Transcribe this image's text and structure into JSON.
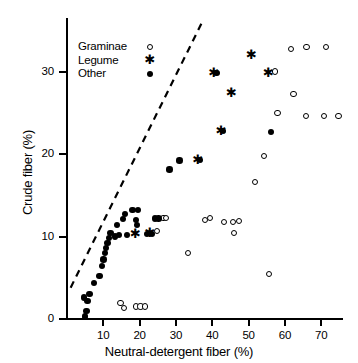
{
  "chart_data": {
    "type": "scatter",
    "title": "",
    "xlabel": "Neutral-detergent fiber (%)",
    "ylabel": "Crude fiber (%)",
    "xlim": [
      0,
      76
    ],
    "ylim": [
      0,
      36
    ],
    "xticks": [
      10,
      20,
      30,
      40,
      50,
      60,
      70
    ],
    "yticks": [
      0,
      10,
      20,
      30
    ],
    "grid": false,
    "legend_position": "upper-left-inside",
    "annotations": [
      {
        "type": "dashed-line",
        "label": "1:1 reference line",
        "x0": 1.0,
        "y0": 3.8,
        "x1": 37.0,
        "y1": 35.8
      }
    ],
    "series": [
      {
        "name": "Graminae",
        "marker": "open-circle",
        "points": [
          [
            15.0,
            1.8
          ],
          [
            16.0,
            1.2
          ],
          [
            19.2,
            1.4
          ],
          [
            20.5,
            1.4
          ],
          [
            21.8,
            1.4
          ],
          [
            33.5,
            7.9
          ],
          [
            43.5,
            11.6
          ],
          [
            46.0,
            11.6
          ],
          [
            46.2,
            10.3
          ],
          [
            47.6,
            11.8
          ],
          [
            38.2,
            11.9
          ],
          [
            39.6,
            12.1
          ],
          [
            55.8,
            5.3
          ],
          [
            52.0,
            16.5
          ],
          [
            54.6,
            19.6
          ],
          [
            58.2,
            24.9
          ],
          [
            57.5,
            29.9
          ],
          [
            62.6,
            27.2
          ],
          [
            66.2,
            32.9
          ],
          [
            71.5,
            32.9
          ],
          [
            62.0,
            32.6
          ],
          [
            66.0,
            24.5
          ],
          [
            71.0,
            24.5
          ],
          [
            75.0,
            24.5
          ],
          [
            26.8,
            12.1
          ],
          [
            27.4,
            12.1
          ],
          [
            25.0,
            10.6
          ]
        ]
      },
      {
        "name": "Legume",
        "marker": "asterisk",
        "points": [
          [
            18.6,
            10.4
          ],
          [
            35.8,
            19.3
          ],
          [
            42.2,
            22.8
          ],
          [
            40.2,
            29.9
          ],
          [
            45.0,
            27.5
          ],
          [
            50.5,
            32.1
          ],
          [
            55.2,
            29.9
          ],
          [
            22.6,
            10.5
          ]
        ]
      },
      {
        "name": "Other",
        "marker": "filled-circle",
        "points": [
          [
            5.0,
            0.3
          ],
          [
            5.4,
            1.0
          ],
          [
            5.6,
            2.2
          ],
          [
            6.2,
            3.0
          ],
          [
            4.6,
            2.6
          ],
          [
            7.4,
            4.4
          ],
          [
            9.0,
            5.2
          ],
          [
            9.6,
            6.4
          ],
          [
            10.0,
            7.2
          ],
          [
            10.4,
            8.0
          ],
          [
            10.8,
            8.6
          ],
          [
            11.2,
            9.2
          ],
          [
            11.6,
            9.8
          ],
          [
            12.0,
            10.4
          ],
          [
            13.2,
            10.0
          ],
          [
            13.8,
            11.4
          ],
          [
            15.4,
            12.1
          ],
          [
            16.0,
            12.7
          ],
          [
            14.4,
            10.2
          ],
          [
            16.6,
            10.2
          ],
          [
            18.0,
            13.2
          ],
          [
            19.6,
            13.2
          ],
          [
            19.0,
            12.0
          ],
          [
            19.2,
            11.4
          ],
          [
            24.2,
            12.2
          ],
          [
            25.2,
            12.2
          ],
          [
            28.2,
            18.1
          ],
          [
            31.0,
            19.2
          ],
          [
            36.6,
            19.3
          ],
          [
            43.0,
            22.8
          ],
          [
            41.2,
            29.8
          ],
          [
            56.2,
            22.7
          ],
          [
            22.0,
            10.3
          ],
          [
            23.4,
            10.3
          ]
        ]
      }
    ]
  },
  "legend": {
    "rows": [
      {
        "label": "Graminae",
        "marker": "open-circle"
      },
      {
        "label": "Legume",
        "marker": "asterisk"
      },
      {
        "label": "Other",
        "marker": "filled-circle"
      }
    ]
  },
  "axes": {
    "x": {
      "title": "Neutral-detergent fiber (%)",
      "tick_labels": [
        "10",
        "20",
        "30",
        "40",
        "50",
        "60",
        "70"
      ]
    },
    "y": {
      "title": "Crude fiber (%)",
      "tick_labels": [
        "0",
        "10",
        "20",
        "30"
      ]
    }
  },
  "colors": {
    "foreground": "#000000",
    "background": "#ffffff"
  }
}
